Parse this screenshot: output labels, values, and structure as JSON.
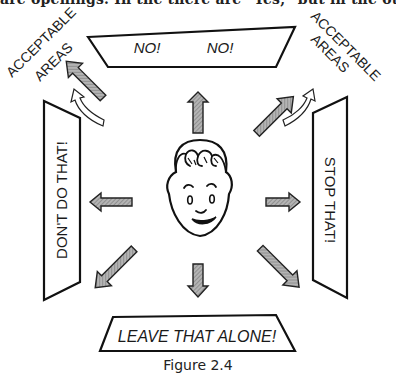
{
  "page": {
    "top_cut_text": "are openings. In the there are \"Yes,\" but in the other"
  },
  "figure": {
    "caption": "Figure 2.4",
    "signs": {
      "top": {
        "word1": "NO!",
        "word2": "NO!"
      },
      "left": {
        "label": "DON'T DO THAT!"
      },
      "right": {
        "label": "STOP THAT!"
      },
      "bottom": {
        "label": "LEAVE THAT ALONE!"
      }
    },
    "acceptable_areas": {
      "left": {
        "line1": "ACCEPTABLE",
        "line2": "AREAS"
      },
      "right": {
        "line1": "ACCEPTABLE",
        "line2": "AREAS"
      }
    },
    "arrow_fill": "#9a9a9a",
    "stroke_color": "#111111"
  }
}
